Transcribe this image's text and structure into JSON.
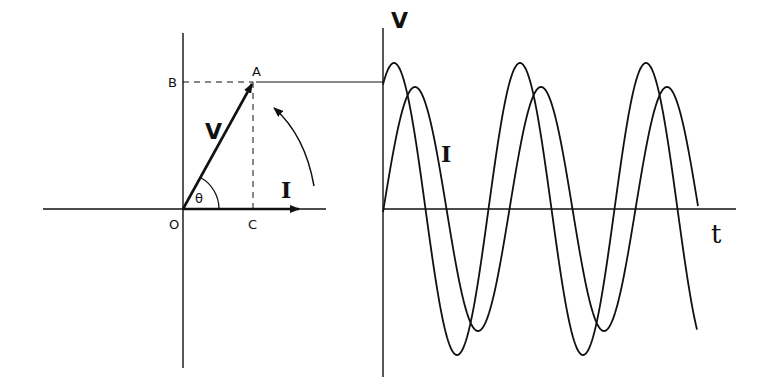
{
  "phasor": {
    "labels": {
      "origin": "O",
      "point_a": "A",
      "point_b": "B",
      "point_c": "C",
      "voltage": "V",
      "current": "I",
      "angle": "θ"
    }
  },
  "waveform": {
    "labels": {
      "voltage": "V",
      "current": "I",
      "time_axis": "t"
    },
    "series": [
      {
        "name": "V",
        "amplitude": 146,
        "period_px": 126,
        "phase_lead": "θ"
      },
      {
        "name": "I",
        "amplitude": 122,
        "period_px": 126,
        "phase_lead": "0"
      }
    ]
  },
  "colors": {
    "ink": "#111111",
    "background": "#ffffff"
  }
}
